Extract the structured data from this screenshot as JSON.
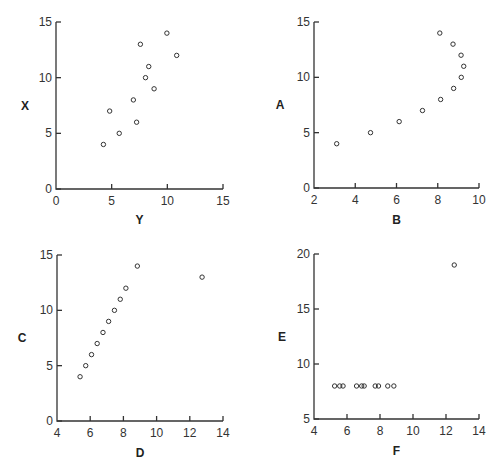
{
  "chart_data": [
    {
      "type": "scatter",
      "title": "",
      "xlabel": "Y",
      "ylabel": "X",
      "xlim": [
        0,
        15
      ],
      "ylim": [
        0,
        15
      ],
      "xticks": [
        0,
        5,
        10,
        15
      ],
      "yticks": [
        0,
        5,
        10,
        15
      ],
      "grid": false,
      "series": [
        {
          "name": "set1",
          "x": [
            8.04,
            6.95,
            7.58,
            8.81,
            8.33,
            9.96,
            7.24,
            4.26,
            10.84,
            4.82,
            5.68
          ],
          "y": [
            10,
            8,
            13,
            9,
            11,
            14,
            6,
            4,
            12,
            7,
            5
          ]
        }
      ],
      "frame": {
        "left": 56,
        "right": 223,
        "top": 22,
        "bottom": 189,
        "ylabel_x": 25,
        "xlabel_y": 224
      }
    },
    {
      "type": "scatter",
      "title": "",
      "xlabel": "B",
      "ylabel": "A",
      "xlim": [
        2,
        10
      ],
      "ylim": [
        0,
        15
      ],
      "xticks": [
        2,
        4,
        6,
        8,
        10
      ],
      "yticks": [
        0,
        5,
        10,
        15
      ],
      "grid": false,
      "series": [
        {
          "name": "set2",
          "x": [
            9.14,
            8.14,
            8.74,
            8.77,
            9.26,
            8.1,
            6.13,
            3.1,
            9.13,
            7.26,
            4.74
          ],
          "y": [
            10,
            8,
            13,
            9,
            11,
            14,
            6,
            4,
            12,
            7,
            5
          ]
        }
      ],
      "frame": {
        "left": 314,
        "right": 479,
        "top": 22,
        "bottom": 188,
        "ylabel_x": 280,
        "xlabel_y": 224
      }
    },
    {
      "type": "scatter",
      "title": "",
      "xlabel": "D",
      "ylabel": "C",
      "xlim": [
        4,
        14
      ],
      "ylim": [
        0,
        15
      ],
      "xticks": [
        4,
        6,
        8,
        10,
        12,
        14
      ],
      "yticks": [
        0,
        5,
        10,
        15
      ],
      "grid": false,
      "series": [
        {
          "name": "set3",
          "x": [
            7.46,
            6.77,
            12.74,
            7.11,
            7.81,
            8.84,
            6.08,
            5.39,
            8.15,
            6.42,
            5.73
          ],
          "y": [
            10,
            8,
            13,
            9,
            11,
            14,
            6,
            4,
            12,
            7,
            5
          ]
        }
      ],
      "frame": {
        "left": 57,
        "right": 223,
        "top": 255,
        "bottom": 421,
        "ylabel_x": 22,
        "xlabel_y": 457
      }
    },
    {
      "type": "scatter",
      "title": "",
      "xlabel": "F",
      "ylabel": "E",
      "xlim": [
        4,
        14
      ],
      "ylim": [
        5,
        20
      ],
      "xticks": [
        4,
        6,
        8,
        10,
        12,
        14
      ],
      "yticks": [
        5,
        10,
        15,
        20
      ],
      "grid": false,
      "series": [
        {
          "name": "set4",
          "x": [
            6.58,
            5.76,
            7.71,
            8.84,
            8.47,
            7.04,
            5.25,
            12.5,
            5.56,
            7.91,
            6.89
          ],
          "y": [
            8,
            8,
            8,
            8,
            8,
            8,
            8,
            19,
            8,
            8,
            8
          ]
        }
      ],
      "frame": {
        "left": 314,
        "right": 479,
        "top": 254,
        "bottom": 419,
        "ylabel_x": 282,
        "xlabel_y": 455
      }
    }
  ]
}
